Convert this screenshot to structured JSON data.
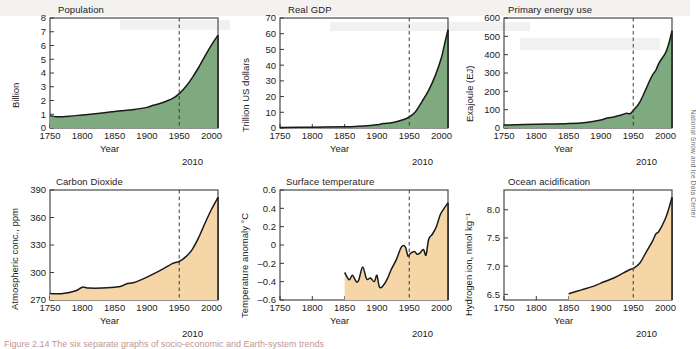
{
  "figure": {
    "credit": "National Snow and Ice Data Center",
    "caption": "Figure 2.14 The six separate graphs of socio-economic and Earth-system trends"
  },
  "colors": {
    "socioeconomic_fill": "#7fa97f",
    "earth_system_fill": "#f6d5a6",
    "line": "#1a1a1a",
    "axis": "#3a3a3a",
    "marker_line": "#3a3a3a"
  },
  "chart_data": [
    {
      "id": "population",
      "type": "area",
      "title": "Population",
      "xlabel": "Year",
      "ylabel": "Billion",
      "end_label": "2010",
      "fill": "#7fa97f",
      "xlim": [
        1750,
        2010
      ],
      "ylim": [
        0,
        8
      ],
      "xticks": [
        1750,
        1800,
        1850,
        1900,
        1950,
        2000
      ],
      "yticks": [
        0,
        1,
        2,
        3,
        4,
        5,
        6,
        7,
        8
      ],
      "marker_year": 1950,
      "grid": false,
      "x": [
        1750,
        1760,
        1780,
        1800,
        1820,
        1840,
        1850,
        1860,
        1880,
        1900,
        1910,
        1920,
        1930,
        1940,
        1950,
        1960,
        1970,
        1980,
        1990,
        2000,
        2010
      ],
      "y": [
        0.9,
        0.82,
        0.86,
        0.95,
        1.04,
        1.14,
        1.2,
        1.25,
        1.35,
        1.5,
        1.65,
        1.78,
        1.95,
        2.15,
        2.5,
        3.0,
        3.65,
        4.4,
        5.25,
        6.05,
        6.75
      ]
    },
    {
      "id": "real-gdp",
      "type": "area",
      "title": "Real GDP",
      "xlabel": "Year",
      "ylabel": "Trillion US dollars",
      "end_label": "2010",
      "fill": "#7fa97f",
      "xlim": [
        1750,
        2010
      ],
      "ylim": [
        0,
        70
      ],
      "xticks": [
        1750,
        1800,
        1850,
        1900,
        1950,
        2000
      ],
      "yticks": [
        0,
        10,
        20,
        30,
        40,
        50,
        60,
        70
      ],
      "marker_year": 1950,
      "grid": false,
      "x": [
        1750,
        1800,
        1850,
        1870,
        1890,
        1900,
        1910,
        1920,
        1930,
        1940,
        1950,
        1960,
        1970,
        1980,
        1990,
        2000,
        2005,
        2010
      ],
      "y": [
        0.3,
        0.5,
        0.8,
        1.1,
        1.6,
        2.0,
        2.8,
        3.2,
        4.0,
        5.2,
        7.0,
        10.5,
        17.0,
        24.0,
        33.0,
        45.0,
        54.0,
        62.5
      ]
    },
    {
      "id": "primary-energy-use",
      "type": "area",
      "title": "Primary energy use",
      "xlabel": "Year",
      "ylabel": "Exajoule (EJ)",
      "end_label": "2010",
      "fill": "#7fa97f",
      "xlim": [
        1750,
        2010
      ],
      "ylim": [
        0,
        600
      ],
      "xticks": [
        1750,
        1800,
        1850,
        1900,
        1950,
        2000
      ],
      "yticks": [
        0,
        100,
        200,
        300,
        400,
        500,
        600
      ],
      "marker_year": 1950,
      "grid": false,
      "x": [
        1750,
        1800,
        1850,
        1880,
        1900,
        1910,
        1920,
        1930,
        1940,
        1945,
        1950,
        1960,
        1970,
        1975,
        1980,
        1985,
        1990,
        2000,
        2005,
        2010
      ],
      "y": [
        16,
        20,
        24,
        32,
        44,
        55,
        60,
        70,
        80,
        78,
        95,
        140,
        215,
        255,
        290,
        315,
        355,
        410,
        460,
        530
      ]
    },
    {
      "id": "carbon-dioxide",
      "type": "area",
      "title": "Carbon Dioxide",
      "xlabel": "Year",
      "ylabel": "Atmospheric conc., ppm",
      "end_label": "2010",
      "fill": "#f6d5a6",
      "xlim": [
        1750,
        2010
      ],
      "ylim": [
        270,
        390
      ],
      "xticks": [
        1750,
        1800,
        1850,
        1900,
        1950,
        2000
      ],
      "yticks": [
        270,
        300,
        330,
        360,
        390
      ],
      "marker_year": 1950,
      "grid": false,
      "x": [
        1750,
        1770,
        1790,
        1800,
        1810,
        1830,
        1850,
        1860,
        1870,
        1880,
        1900,
        1920,
        1940,
        1950,
        1960,
        1970,
        1980,
        1990,
        2000,
        2010
      ],
      "y": [
        277,
        277,
        280,
        284,
        283,
        283,
        284,
        285,
        288,
        289,
        295,
        302,
        310,
        312,
        317,
        325,
        338,
        354,
        369,
        382
      ]
    },
    {
      "id": "surface-temperature",
      "type": "area",
      "title": "Surface temperature",
      "xlabel": "Year",
      "ylabel": "Temperature anomaly °C",
      "end_label": "2010",
      "fill": "#f6d5a6",
      "xlim": [
        1750,
        2010
      ],
      "ylim": [
        -0.6,
        0.6
      ],
      "xticks": [
        1750,
        1800,
        1850,
        1900,
        1950,
        2000
      ],
      "yticks": [
        -0.6,
        -0.4,
        -0.2,
        0,
        0.2,
        0.4,
        0.6
      ],
      "marker_year": 1950,
      "grid": false,
      "data_start_year": 1850,
      "x": [
        1850,
        1857,
        1862,
        1868,
        1872,
        1878,
        1884,
        1890,
        1896,
        1900,
        1904,
        1910,
        1916,
        1922,
        1930,
        1938,
        1944,
        1948,
        1952,
        1958,
        1962,
        1966,
        1972,
        1976,
        1980,
        1986,
        1992,
        1998,
        2004,
        2010
      ],
      "y": [
        -0.3,
        -0.38,
        -0.33,
        -0.4,
        -0.38,
        -0.24,
        -0.37,
        -0.36,
        -0.4,
        -0.33,
        -0.46,
        -0.44,
        -0.37,
        -0.27,
        -0.16,
        -0.02,
        -0.02,
        -0.12,
        -0.09,
        -0.07,
        -0.1,
        -0.09,
        -0.05,
        -0.11,
        0.06,
        0.12,
        0.2,
        0.33,
        0.4,
        0.46
      ]
    },
    {
      "id": "ocean-acidification",
      "type": "area",
      "title": "Ocean acidification",
      "xlabel": "Year",
      "ylabel": "Hydrogen ion, nmol kg⁻¹",
      "end_label": "2010",
      "fill": "#f6d5a6",
      "xlim": [
        1750,
        2010
      ],
      "ylim": [
        6.4,
        8.35
      ],
      "xticks": [
        1750,
        1800,
        1850,
        1900,
        1950,
        2000
      ],
      "yticks": [
        6.5,
        7.0,
        7.5,
        8.0
      ],
      "marker_year": 1950,
      "grid": false,
      "data_start_year": 1850,
      "x": [
        1850,
        1870,
        1890,
        1900,
        1920,
        1935,
        1945,
        1950,
        1960,
        1970,
        1980,
        1985,
        1990,
        2000,
        2005,
        2010
      ],
      "y": [
        6.51,
        6.58,
        6.65,
        6.7,
        6.79,
        6.88,
        6.94,
        6.96,
        7.05,
        7.25,
        7.45,
        7.57,
        7.62,
        7.85,
        8.02,
        8.22
      ]
    }
  ]
}
